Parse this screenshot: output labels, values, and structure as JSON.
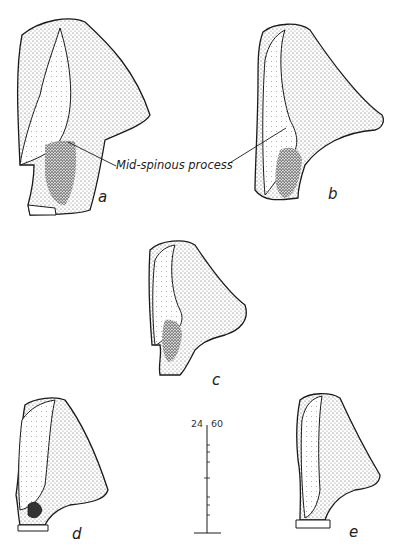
{
  "figure": {
    "callout_label": "Mid-spinous process",
    "specimens": [
      {
        "id": "a",
        "label": "a"
      },
      {
        "id": "b",
        "label": "b"
      },
      {
        "id": "c",
        "label": "c"
      },
      {
        "id": "d",
        "label": "d"
      },
      {
        "id": "e",
        "label": "e"
      }
    ],
    "scale_bar": {
      "label_left": "24",
      "label_right": "60",
      "label": "24-60"
    },
    "colors": {
      "ink": "#1a1a1a",
      "stipple_dark": "#555555",
      "stipple_light": "#bbbbbb",
      "background": "#ffffff"
    }
  }
}
